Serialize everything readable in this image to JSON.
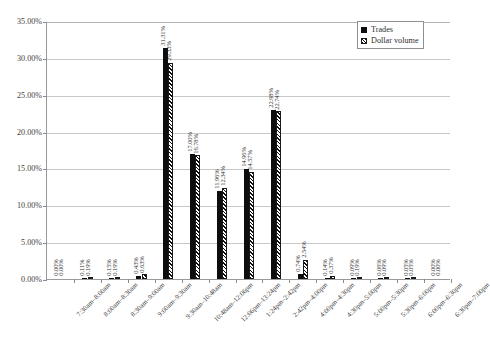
{
  "chart_data": {
    "type": "bar",
    "title": "",
    "subtitle": "",
    "xlabel": "",
    "ylabel": "",
    "ylim": [
      0,
      35
    ],
    "ytick_labels": [
      "0.00%",
      "5.00%",
      "10.00%",
      "15.00%",
      "20.00%",
      "25.00%",
      "30.00%",
      "35.00%"
    ],
    "ytick_values": [
      0,
      5,
      10,
      15,
      20,
      25,
      30,
      35
    ],
    "grid": true,
    "legend_position": "top-right",
    "categories": [
      "7:30am–8:00am",
      "8:00am–8:30am",
      "8:30am–9:00am",
      "9:00am–9:30am",
      "9:30am–10:48am",
      "10:48am–12:06pm",
      "12:06pm–13:24pm",
      "1:24pm–2:42pm",
      "2:42pm–4:00pm",
      "4:00pm–4:30pm",
      "4:30pm–5:00pm",
      "5:00pm–5:30pm",
      "5:30pm–6:00pm",
      "6:00pm–6:30pm",
      "6:30pm–7:00pm"
    ],
    "series": [
      {
        "name": "Trades",
        "color": "#0d0d0d",
        "values": [
          0.0,
          0.11,
          0.15,
          0.43,
          31.31,
          17.0,
          11.96,
          14.96,
          22.98,
          0.74,
          0.14,
          0.09,
          0.06,
          0.05,
          0.0
        ],
        "labels": [
          "0.00%",
          "0.11%",
          "0.15%",
          "0.43%",
          "31.31%",
          "17.00%",
          "11.96%",
          "14.96%",
          "22.98%",
          "0.74%",
          "0.14%",
          "0.09%",
          "0.06%",
          "0.05%",
          "0.00%"
        ]
      },
      {
        "name": "Dollar volume",
        "color": "#0d0d0d",
        "pattern": "diagonal-hatch",
        "values": [
          0.0,
          0.19,
          0.19,
          0.63,
          29.33,
          16.78,
          12.34,
          14.57,
          22.74,
          2.54,
          0.37,
          0.19,
          0.09,
          0.05,
          0.0
        ],
        "labels": [
          "0.00%",
          "0.19%",
          "0.19%",
          "0.63%",
          "29.33%",
          "16.78%",
          "12.34%",
          "14.57%",
          "22.74%",
          "2.54%",
          "0.37%",
          "0.19%",
          "0.09%",
          "0.05%",
          "0.00%"
        ]
      }
    ]
  },
  "legend": {
    "items": [
      {
        "label": "Trades"
      },
      {
        "label": "Dollar volume"
      }
    ]
  }
}
